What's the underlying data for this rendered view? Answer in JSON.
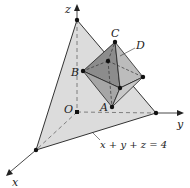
{
  "diagram": {
    "axes": {
      "x_label": "x",
      "y_label": "y",
      "z_label": "z",
      "origin_label": "O"
    },
    "plane": {
      "equation": "x + y + z = 4",
      "fill": "#dcdcdc"
    },
    "octahedron": {
      "vertex_labels": [
        "A",
        "B",
        "C",
        "D"
      ],
      "face_colors": [
        "#8a8a8a",
        "#a8a8a8",
        "#c4c4c4"
      ]
    }
  }
}
